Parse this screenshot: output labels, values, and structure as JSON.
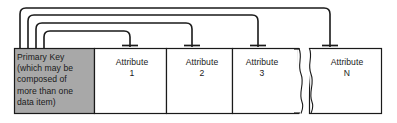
{
  "diagram": {
    "name": "record-structure-diagram",
    "type": "entity-record-with-attribute-pointers",
    "colors": {
      "primary_key_fill": "#a8a8a8",
      "attribute_fill": "#ffffff",
      "stroke": "#1a1a1a",
      "cell_divider": "#555555",
      "background": "#ffffff",
      "text": "#1a1a1a"
    },
    "record": {
      "primary_key_cell": {
        "label": "Primary Key\n(which may be\ncomposed of\nmore than one\ndata item)",
        "lines": [
          "Primary Key",
          "(which may be",
          "composed of",
          "more than one",
          "data item)"
        ],
        "fill": "#a8a8a8"
      },
      "attribute_cells": [
        {
          "label": "Attribute\n1",
          "name": "Attribute",
          "index": "1"
        },
        {
          "label": "Attribute\n2",
          "name": "Attribute",
          "index": "2"
        },
        {
          "label": "Attribute\n3",
          "name": "Attribute",
          "index": "3"
        },
        {
          "label": "Attribute\nN",
          "name": "Attribute",
          "index": "N"
        }
      ],
      "break_symbol": {
        "name": "torn-break",
        "meaning": "omitted intermediate attributes",
        "between": [
          "Attribute 3",
          "Attribute N"
        ]
      }
    },
    "connectors": {
      "count": 4,
      "description": "Rounded elbow lines from the primary key cell to the top of each attribute cell, each ending in a crossbar tick.",
      "links": [
        {
          "from": "Primary Key",
          "to": "Attribute 1"
        },
        {
          "from": "Primary Key",
          "to": "Attribute 2"
        },
        {
          "from": "Primary Key",
          "to": "Attribute 3"
        },
        {
          "from": "Primary Key",
          "to": "Attribute N"
        }
      ]
    }
  }
}
